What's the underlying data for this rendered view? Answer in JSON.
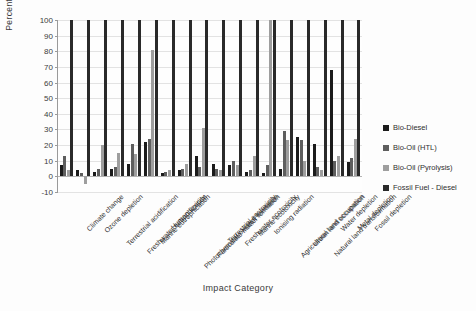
{
  "chart_data": {
    "type": "bar",
    "title": "",
    "xlabel": "Impact Category",
    "ylabel": "Percentage",
    "ylim": [
      -10,
      100
    ],
    "ytick_step": 10,
    "yticks": [
      "100",
      "90",
      "80",
      "70",
      "60",
      "50",
      "40",
      "30",
      "20",
      "10",
      "0",
      "-10"
    ],
    "grid": true,
    "legend_position": "right",
    "categories": [
      "Climate change",
      "Ozone depletion",
      "Terrestrial acidification",
      "Freshwater eutrophication",
      "Marine eutrophication",
      "Human toxicity",
      "Photochemical oxidant formation",
      "Particulate matter formation",
      "Terrestrial ecotoxicity",
      "Freshwater ecotoxicity",
      "Marine ecotoxicity",
      "Ionising radiation",
      "Agricultural land occupation",
      "Urban land occupation",
      "Natural land transformation",
      "Water depletion",
      "Metal depletion",
      "Fossil depletion"
    ],
    "series": [
      {
        "name": "Bio-Diesel",
        "color": "#1b1b1b",
        "values": [
          7,
          4,
          3,
          5,
          8,
          22,
          2,
          4,
          13,
          8,
          7,
          3,
          2,
          5,
          25,
          21,
          68,
          9
        ]
      },
      {
        "name": "Bio-Oil (HTL)",
        "color": "#5e5e5e",
        "values": [
          13,
          2,
          5,
          6,
          21,
          24,
          3,
          5,
          6,
          5,
          10,
          4,
          7,
          29,
          23,
          6,
          10,
          12
        ]
      },
      {
        "name": "Bio-Oil (Pyrolysis)",
        "color": "#9e9e9e",
        "values": [
          4,
          -5,
          20,
          15,
          14,
          81,
          4,
          8,
          31,
          4,
          7,
          13,
          100,
          23,
          10,
          4,
          13,
          24
        ]
      },
      {
        "name": "Fossil Fuel - Diesel",
        "color": "#2a2a2a",
        "values": [
          100,
          100,
          100,
          100,
          100,
          100,
          100,
          100,
          100,
          100,
          100,
          100,
          100,
          100,
          100,
          100,
          100,
          100
        ]
      }
    ]
  },
  "legend": {
    "items": [
      {
        "label": "Bio-Diesel"
      },
      {
        "label": "Bio-Oil (HTL)"
      },
      {
        "label": "Bio-Oil (Pyrolysis)"
      },
      {
        "label": "Fossil Fuel - Diesel"
      }
    ]
  }
}
